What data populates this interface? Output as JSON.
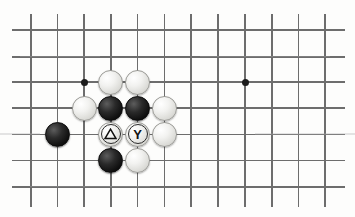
{
  "figure": {
    "kind": "go-board-diagram",
    "board_background_color": "#fdfdfc",
    "line_color": "#6d6d6d",
    "star_point_color": "#1c1c1c",
    "black_stone_color": "#101010",
    "white_stone_color": "#f2f2f0",
    "mark_color": "#111111"
  },
  "grid": {
    "vertical_line_x": [
      31,
      57.5,
      84,
      110.8,
      137.6,
      164.3,
      191,
      218,
      245,
      271.8,
      298.5,
      325
    ],
    "horizontal_line_y": [
      30,
      56.8,
      82,
      108,
      134.3,
      160.5,
      187
    ],
    "line_thickness_px": 1.6
  },
  "star_points": [
    {
      "name": "star-point-left",
      "x": 84,
      "y": 82
    },
    {
      "name": "star-point-right",
      "x": 245,
      "y": 82
    }
  ],
  "stones": [
    {
      "id": "w1",
      "color": "white",
      "x": 110.8,
      "y": 82,
      "mark": ""
    },
    {
      "id": "w2",
      "color": "white",
      "x": 137.6,
      "y": 82,
      "mark": ""
    },
    {
      "id": "w3",
      "color": "white",
      "x": 84,
      "y": 108,
      "mark": ""
    },
    {
      "id": "b1",
      "color": "black",
      "x": 110.8,
      "y": 108,
      "mark": ""
    },
    {
      "id": "b2",
      "color": "black",
      "x": 137.6,
      "y": 108,
      "mark": ""
    },
    {
      "id": "w4",
      "color": "white",
      "x": 164.3,
      "y": 108,
      "mark": ""
    },
    {
      "id": "b3",
      "color": "black",
      "x": 57.5,
      "y": 134.3,
      "mark": ""
    },
    {
      "id": "w5",
      "color": "white",
      "x": 110.8,
      "y": 134.3,
      "mark": "triangle"
    },
    {
      "id": "w6",
      "color": "white",
      "x": 137.6,
      "y": 134.3,
      "mark": "Y"
    },
    {
      "id": "w7",
      "color": "white",
      "x": 164.3,
      "y": 134.3,
      "mark": ""
    },
    {
      "id": "b4",
      "color": "black",
      "x": 110.8,
      "y": 160.5,
      "mark": ""
    },
    {
      "id": "w8",
      "color": "white",
      "x": 137.6,
      "y": 160.5,
      "mark": ""
    }
  ],
  "marks": {
    "triangle_glyph": "△",
    "y_glyph": "Y"
  },
  "smudges": [
    {
      "x": 20,
      "y": 56.8,
      "width": 80
    },
    {
      "x": 200,
      "y": 56.8,
      "width": 130
    },
    {
      "x": 0,
      "y": 134.3,
      "width": 40
    },
    {
      "x": 255,
      "y": 134.3,
      "width": 100
    },
    {
      "x": 30,
      "y": 187,
      "width": 120
    }
  ]
}
